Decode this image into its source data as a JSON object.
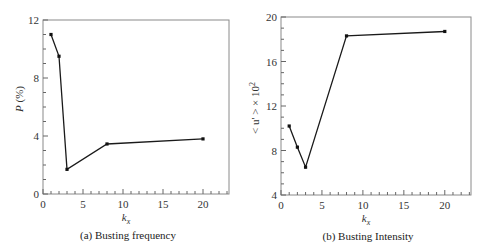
{
  "chart_data": [
    {
      "type": "line",
      "title": "",
      "caption": "(a) Busting frequency",
      "xlabel": "k_x",
      "xlabel_main": "k",
      "xlabel_sub": "x",
      "ylabel": "P (%)",
      "ylabel_italic": "P",
      "ylabel_rest": " (%)",
      "xlim": [
        0,
        23.25
      ],
      "ylim": [
        0,
        12
      ],
      "xticks": [
        0,
        5,
        10,
        15,
        20
      ],
      "yticks": [
        0,
        4,
        8,
        12
      ],
      "grid": false,
      "legend": null,
      "x": [
        1,
        2,
        3,
        8,
        20
      ],
      "series": [
        {
          "name": "P",
          "values": [
            11.0,
            9.5,
            1.7,
            3.45,
            3.8
          ]
        }
      ]
    },
    {
      "type": "line",
      "title": "",
      "caption": "(b) Busting Intensity",
      "xlabel": "k_x",
      "xlabel_main": "k",
      "xlabel_sub": "x",
      "ylabel": "< u' > × 10^2",
      "ylabel_base": "< u' > × 10",
      "ylabel_sup": "2",
      "xlim": [
        0,
        23.2
      ],
      "ylim": [
        4,
        20
      ],
      "xticks": [
        0,
        5,
        10,
        15,
        20
      ],
      "yticks": [
        4,
        8,
        12,
        16,
        20
      ],
      "grid": false,
      "legend": null,
      "x": [
        1,
        2,
        3,
        8,
        20
      ],
      "series": [
        {
          "name": "<u'> x 10^2",
          "values": [
            10.2,
            8.3,
            6.5,
            18.3,
            18.7
          ]
        }
      ]
    }
  ]
}
